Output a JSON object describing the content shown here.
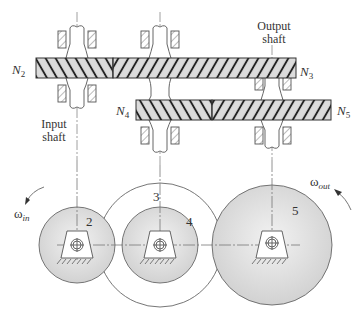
{
  "diagram": {
    "type": "compound gear train",
    "labels": {
      "n2": "N",
      "n2_sub": "2",
      "n3": "N",
      "n3_sub": "3",
      "n4": "N",
      "n4_sub": "4",
      "n5": "N",
      "n5_sub": "5",
      "input_shaft_line1": "Input",
      "input_shaft_line2": "shaft",
      "output_shaft_line1": "Output",
      "output_shaft_line2": "shaft",
      "omega_in": "ω",
      "omega_in_sub": "in",
      "omega_out": "ω",
      "omega_out_sub": "out",
      "gear2": "2",
      "gear3": "3",
      "gear4": "4",
      "gear5": "5"
    },
    "colors": {
      "gear_fill": "#d8d8d8",
      "line": "#555555",
      "background": "#ffffff"
    }
  }
}
